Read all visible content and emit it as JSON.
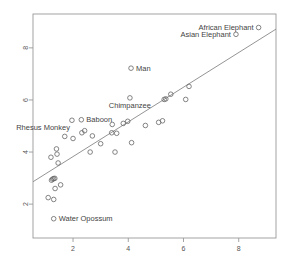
{
  "chart_data": {
    "type": "scatter",
    "title": "",
    "xlabel": "",
    "ylabel": "",
    "xlim": [
      0.55,
      9.35
    ],
    "ylim": [
      0.7,
      9.3
    ],
    "xticks": [
      2,
      4,
      6,
      8
    ],
    "yticks": [
      2,
      4,
      6,
      8
    ],
    "xtick_labels": [
      "2",
      "4",
      "6",
      "8"
    ],
    "ytick_labels": [
      "2",
      "4",
      "6",
      "8"
    ],
    "grid": false,
    "legend": "none",
    "point_style": "open-circle",
    "point_color": "#666666",
    "line_color": "#888888",
    "axis_color": "#999999",
    "fit_line": {
      "type": "linear-regression",
      "x_start": 0.55,
      "y_start": 2.86,
      "x_end": 9.35,
      "y_end": 8.72
    },
    "points": [
      {
        "x": 1.1,
        "y": 2.25,
        "label": ""
      },
      {
        "x": 1.3,
        "y": 2.18,
        "label": ""
      },
      {
        "x": 1.3,
        "y": 1.44,
        "label": "Water Opossum",
        "label_pos": "right"
      },
      {
        "x": 1.35,
        "y": 2.6,
        "label": ""
      },
      {
        "x": 1.22,
        "y": 2.92,
        "label": ""
      },
      {
        "x": 1.26,
        "y": 2.96,
        "label": ""
      },
      {
        "x": 1.3,
        "y": 2.98,
        "label": ""
      },
      {
        "x": 1.34,
        "y": 2.99,
        "label": ""
      },
      {
        "x": 1.55,
        "y": 2.74,
        "label": ""
      },
      {
        "x": 1.2,
        "y": 3.8,
        "label": ""
      },
      {
        "x": 1.4,
        "y": 4.12,
        "label": ""
      },
      {
        "x": 1.42,
        "y": 3.92,
        "label": ""
      },
      {
        "x": 1.46,
        "y": 3.58,
        "label": ""
      },
      {
        "x": 1.96,
        "y": 5.22,
        "label": "Rhesus Monkey",
        "label_pos": "below-left"
      },
      {
        "x": 2.3,
        "y": 5.24,
        "label": "Baboon",
        "label_pos": "right"
      },
      {
        "x": 1.7,
        "y": 4.6,
        "label": ""
      },
      {
        "x": 2.0,
        "y": 4.52,
        "label": ""
      },
      {
        "x": 2.32,
        "y": 4.74,
        "label": ""
      },
      {
        "x": 2.42,
        "y": 4.82,
        "label": ""
      },
      {
        "x": 2.7,
        "y": 4.62,
        "label": ""
      },
      {
        "x": 2.62,
        "y": 4.0,
        "label": ""
      },
      {
        "x": 3.0,
        "y": 4.32,
        "label": ""
      },
      {
        "x": 3.4,
        "y": 4.74,
        "label": ""
      },
      {
        "x": 3.42,
        "y": 5.06,
        "label": ""
      },
      {
        "x": 3.58,
        "y": 4.72,
        "label": ""
      },
      {
        "x": 3.52,
        "y": 4.0,
        "label": ""
      },
      {
        "x": 3.82,
        "y": 5.1,
        "label": ""
      },
      {
        "x": 3.98,
        "y": 5.18,
        "label": ""
      },
      {
        "x": 4.06,
        "y": 6.08,
        "label": "Chimpanzee",
        "label_pos": "below"
      },
      {
        "x": 4.1,
        "y": 7.22,
        "label": "Man",
        "label_pos": "right"
      },
      {
        "x": 4.12,
        "y": 4.36,
        "label": ""
      },
      {
        "x": 4.62,
        "y": 5.02,
        "label": ""
      },
      {
        "x": 5.1,
        "y": 5.14,
        "label": ""
      },
      {
        "x": 5.24,
        "y": 5.2,
        "label": ""
      },
      {
        "x": 5.3,
        "y": 6.02,
        "label": ""
      },
      {
        "x": 5.36,
        "y": 6.04,
        "label": ""
      },
      {
        "x": 5.54,
        "y": 6.22,
        "label": ""
      },
      {
        "x": 6.08,
        "y": 6.02,
        "label": ""
      },
      {
        "x": 6.2,
        "y": 6.52,
        "label": ""
      },
      {
        "x": 7.9,
        "y": 8.52,
        "label": "Asian Elephant",
        "label_pos": "left"
      },
      {
        "x": 8.72,
        "y": 8.78,
        "label": "African Elephant",
        "label_pos": "left"
      }
    ]
  }
}
